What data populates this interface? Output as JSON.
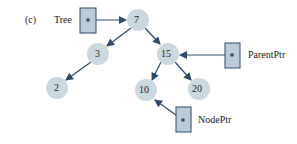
{
  "figure_label": "(c)",
  "pointers": {
    "tree": "Tree",
    "parent": "ParentPtr",
    "node": "NodePtr"
  },
  "nodes": [
    "7",
    "3",
    "15",
    "2",
    "10",
    "20"
  ],
  "colors": {
    "node_fill": "#ccd8e0",
    "box_fill": "#bccbd8",
    "box_stroke": "#2d4a6b",
    "arrow": "#2d4a6b"
  }
}
